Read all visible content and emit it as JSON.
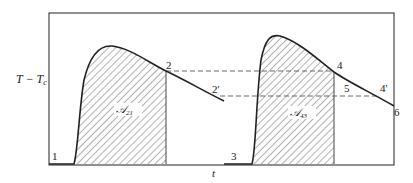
{
  "diagram": {
    "y_axis_label": "T − T",
    "y_axis_label_sub": "c",
    "x_axis_label": "t",
    "points": {
      "p1": "1",
      "p2": "2",
      "p2prime": "2'",
      "p3": "3",
      "p4": "4",
      "p4prime": "4'",
      "p5": "5",
      "p6": "6"
    },
    "areas": {
      "first": {
        "symbol": "𝒜",
        "subscript": "21"
      },
      "second": {
        "symbol": "𝒜",
        "subscript": "43"
      }
    },
    "colors": {
      "line": "#222222",
      "hatch": "#555555",
      "dashed": "#444444"
    }
  }
}
